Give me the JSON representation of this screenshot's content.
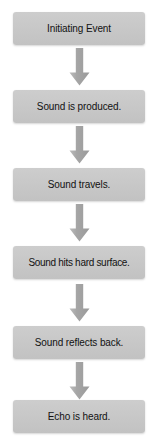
{
  "diagram": {
    "orientation": "vertical",
    "background_color": "#ffffff",
    "box_fill_color": "#c7c7c7",
    "box_text_color": "#121212",
    "arrow_color": "#a8a8a8",
    "steps": [
      {
        "label": "Initiating Event"
      },
      {
        "label": "Sound is produced."
      },
      {
        "label": "Sound travels."
      },
      {
        "label": "Sound hits hard surface."
      },
      {
        "label": "Sound reflects back."
      },
      {
        "label": "Echo is heard."
      }
    ],
    "connectors": [
      {
        "icon": "arrow-down-icon",
        "from": "Initiating Event",
        "to": "Sound is produced."
      },
      {
        "icon": "arrow-down-icon",
        "from": "Sound is produced.",
        "to": "Sound travels."
      },
      {
        "icon": "arrow-down-icon",
        "from": "Sound travels.",
        "to": "Sound hits hard surface."
      },
      {
        "icon": "arrow-down-icon",
        "from": "Sound hits hard surface.",
        "to": "Sound reflects back."
      },
      {
        "icon": "arrow-down-icon",
        "from": "Sound reflects back.",
        "to": "Echo is heard."
      }
    ]
  }
}
